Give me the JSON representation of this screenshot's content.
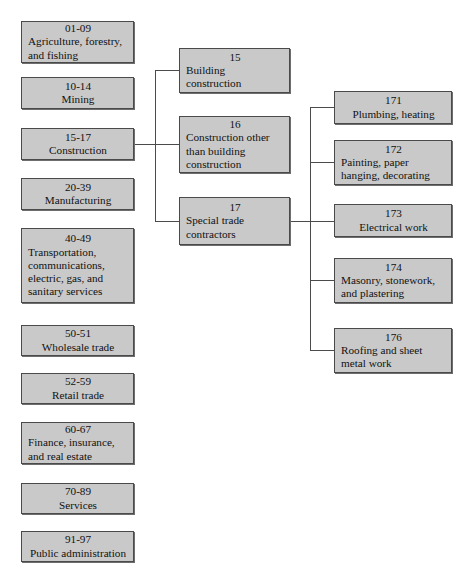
{
  "diagram": {
    "box_fill": "#c9c9c9",
    "box_border": "#4a4a4a",
    "edge_color": "#4b4b4b",
    "columns": {
      "divisions": {
        "name": "Division level (2-digit major groups)",
        "nodes": [
          {
            "code": "01-09",
            "label": "Agriculture, forestry,\nand fishing",
            "align": "left"
          },
          {
            "code": "10-14",
            "label": "Mining",
            "align": "center"
          },
          {
            "code": "15-17",
            "label": "Construction",
            "align": "center"
          },
          {
            "code": "20-39",
            "label": "Manufacturing",
            "align": "center"
          },
          {
            "code": "40-49",
            "label": "Transportation,\ncommunications,\nelectric, gas, and\nsanitary services",
            "align": "left"
          },
          {
            "code": "50-51",
            "label": "Wholesale trade",
            "align": "center"
          },
          {
            "code": "52-59",
            "label": "Retail trade",
            "align": "center"
          },
          {
            "code": "60-67",
            "label": "Finance, insurance,\nand real estate",
            "align": "left"
          },
          {
            "code": "70-89",
            "label": "Services",
            "align": "center"
          },
          {
            "code": "91-97",
            "label": "Public administration",
            "align": "center"
          }
        ]
      },
      "major_groups": {
        "name": "Construction major groups (2-digit)",
        "nodes": [
          {
            "code": "15",
            "label": "Building\nconstruction",
            "align": "left"
          },
          {
            "code": "16",
            "label": "Construction other\nthan building\nconstruction",
            "align": "left"
          },
          {
            "code": "17",
            "label": "Special trade\ncontractors",
            "align": "left"
          }
        ]
      },
      "industry_groups": {
        "name": "Special trade contractor industry groups (3-digit)",
        "nodes": [
          {
            "code": "171",
            "label": "Plumbing, heating",
            "align": "center"
          },
          {
            "code": "172",
            "label": "Painting, paper\nhanging, decorating",
            "align": "left"
          },
          {
            "code": "173",
            "label": "Electrical work",
            "align": "center"
          },
          {
            "code": "174",
            "label": "Masonry, stonework,\nand plastering",
            "align": "left"
          },
          {
            "code": "176",
            "label": "Roofing and sheet\nmetal work",
            "align": "left"
          }
        ]
      }
    }
  }
}
